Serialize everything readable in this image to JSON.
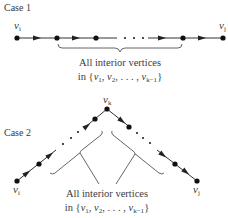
{
  "case1": {
    "title": "Case 1",
    "start_label": "v",
    "start_sub": "i",
    "end_label": "v",
    "end_sub": "j",
    "caption_line1": "All interior vertices",
    "caption_line2_prefix": "in {",
    "caption_set": [
      "v1",
      "v2",
      "...",
      "vk−1"
    ],
    "caption_v": "v",
    "caption_sub1": "1",
    "caption_sub2": "2",
    "caption_dots": ", . . . ,",
    "caption_subk": "k−1",
    "caption_close": "}"
  },
  "case2": {
    "title": "Case 2",
    "apex_label": "v",
    "apex_sub": "k",
    "start_label": "v",
    "start_sub": "i",
    "end_label": "v",
    "end_sub": "j",
    "caption_line1": "All interior vertices",
    "caption_line2_prefix": "in {",
    "caption_v": "v",
    "caption_sub1": "1",
    "caption_sub2": "2",
    "caption_dots": ", . . . ,",
    "caption_subk": "k−1",
    "caption_close": "}"
  },
  "colors": {
    "background": "#ffffff",
    "ink": "#222222"
  }
}
